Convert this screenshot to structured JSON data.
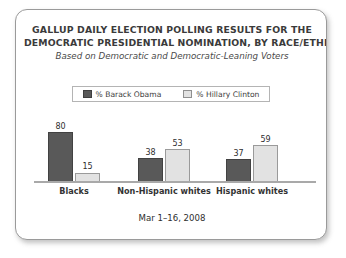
{
  "card": {
    "title_lines": [
      "GALLUP DAILY ELECTION POLLING RESULTS FOR THE",
      "DEMOCRATIC PRESIDENTIAL NOMINATION, BY RACE/ETHNICITY"
    ],
    "subtitle": "Based on Democratic and Democratic-Leaning Voters",
    "footer": "Mar 1–16, 2008"
  },
  "colors": {
    "obama_fill": "#595959",
    "obama_edge": "#424242",
    "clinton_fill": "#e2e2e2",
    "clinton_edge": "#9a9a9a",
    "axis": "#a9a9a9",
    "text": "#333333"
  },
  "chart_data": {
    "type": "bar",
    "title": "GALLUP DAILY ELECTION POLLING RESULTS FOR THE DEMOCRATIC PRESIDENTIAL NOMINATION, BY RACE/ETHNICITY",
    "subtitle": "Based on Democratic and Democratic-Leaning Voters",
    "annotation": "Mar 1–16, 2008",
    "xlabel": "",
    "ylabel": "",
    "ylim": [
      0,
      100
    ],
    "grid": false,
    "legend_position": "top-center",
    "categories": [
      "Blacks",
      "Non-Hispanic whites",
      "Hispanic whites"
    ],
    "series": [
      {
        "name": "% Barack Obama",
        "values": [
          80,
          38,
          37
        ]
      },
      {
        "name": "% Hillary Clinton",
        "values": [
          15,
          53,
          59
        ]
      }
    ]
  }
}
